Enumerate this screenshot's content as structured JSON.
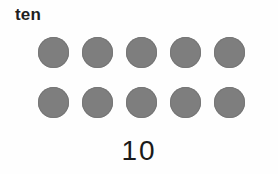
{
  "card": {
    "word_label": "ten",
    "numeral": "10",
    "count": 10,
    "dot_color": "#7e7e7e",
    "background_color": "#fefefe",
    "text_color": "#1f1f1f",
    "rows": [
      {
        "dots": [
          "dot",
          "dot",
          "dot",
          "dot",
          "dot"
        ]
      },
      {
        "dots": [
          "dot",
          "dot",
          "dot",
          "dot",
          "dot"
        ]
      }
    ]
  }
}
